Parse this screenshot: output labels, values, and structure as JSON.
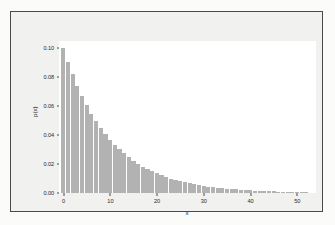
{
  "figure": {
    "background_color": "#f1f1ef",
    "page_color": "#fbfbfa",
    "frame_color": "#4a4a4a",
    "plot_background_color": "#ffffff"
  },
  "chart_data": {
    "type": "bar",
    "title": "",
    "subtitle": "",
    "xlabel": "x",
    "ylabel": "p(x)",
    "xlim": [
      -1,
      54
    ],
    "ylim": [
      0.0,
      0.105
    ],
    "grid": false,
    "legend": null,
    "bar_color": "#b2b2b2",
    "bar_edge_color": "#ffffff",
    "xticks": [
      0,
      10,
      20,
      30,
      40,
      50
    ],
    "xtick_labels": [
      "0",
      "10",
      "20",
      "30",
      "40",
      "50"
    ],
    "yticks": [
      0.0,
      0.02,
      0.04,
      0.06,
      0.08,
      0.1
    ],
    "ytick_labels": [
      "0.00",
      "0.02",
      "0.04",
      "0.06",
      "0.08",
      "0.10"
    ],
    "categories": [
      0,
      1,
      2,
      3,
      4,
      5,
      6,
      7,
      8,
      9,
      10,
      11,
      12,
      13,
      14,
      15,
      16,
      17,
      18,
      19,
      20,
      21,
      22,
      23,
      24,
      25,
      26,
      27,
      28,
      29,
      30,
      31,
      32,
      33,
      34,
      35,
      36,
      37,
      38,
      39,
      40,
      41,
      42,
      43,
      44,
      45,
      46,
      47,
      48,
      49,
      50,
      51,
      52
    ],
    "values": [
      0.1,
      0.0905,
      0.0819,
      0.0741,
      0.067,
      0.0607,
      0.0549,
      0.0497,
      0.0449,
      0.0407,
      0.0368,
      0.0333,
      0.0301,
      0.0273,
      0.0247,
      0.0223,
      0.0202,
      0.0183,
      0.0165,
      0.015,
      0.0135,
      0.0122,
      0.0111,
      0.01,
      0.0091,
      0.0082,
      0.0074,
      0.0067,
      0.0061,
      0.0055,
      0.005,
      0.0045,
      0.0041,
      0.0037,
      0.0033,
      0.003,
      0.0027,
      0.0025,
      0.0022,
      0.002,
      0.0018,
      0.0017,
      0.0015,
      0.0014,
      0.0012,
      0.0011,
      0.001,
      0.0009,
      0.0008,
      0.0007,
      0.0007,
      0.0006,
      0.0006
    ]
  }
}
